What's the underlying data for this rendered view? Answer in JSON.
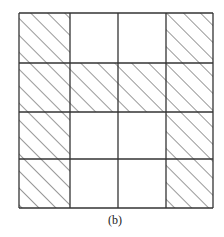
{
  "figure": {
    "label": "(b)",
    "rows": 4,
    "cols": 4,
    "x_lines": [
      19,
      70,
      118,
      166,
      213
    ],
    "y_lines": [
      13,
      63,
      112,
      159,
      208
    ],
    "cells": [
      [
        1,
        0,
        0,
        1
      ],
      [
        1,
        1,
        1,
        1
      ],
      [
        1,
        0,
        0,
        1
      ],
      [
        1,
        0,
        0,
        1
      ]
    ],
    "legend": {
      "1": "hatched",
      "0": "empty"
    },
    "colors": {
      "line": "#333333",
      "hatch": "#444444",
      "background": "#ffffff"
    }
  }
}
